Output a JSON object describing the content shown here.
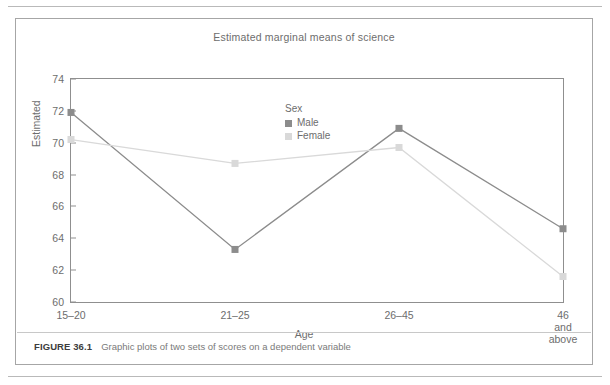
{
  "figure": {
    "caption_label": "FIGURE 36.1",
    "caption_text": "Graphic plots of two sets of scores on a dependent variable"
  },
  "chart_data": {
    "type": "line",
    "title": "Estimated marginal means of science",
    "xlabel": "Age",
    "ylabel": "Estimated",
    "categories": [
      "15–20",
      "21–25",
      "26–45",
      "46 and\nabove"
    ],
    "yticks": [
      60,
      62,
      64,
      66,
      68,
      70,
      72,
      74
    ],
    "ylim": [
      60,
      74
    ],
    "grid": false,
    "legend_title": "Sex",
    "legend_position": "inside-top-center",
    "series": [
      {
        "name": "Male",
        "color": "#8c8c8c",
        "marker": "square",
        "values": [
          71.9,
          63.3,
          70.9,
          64.6
        ]
      },
      {
        "name": "Female",
        "color": "#d9d9d9",
        "marker": "square",
        "values": [
          70.2,
          68.7,
          69.7,
          61.6
        ]
      }
    ]
  }
}
